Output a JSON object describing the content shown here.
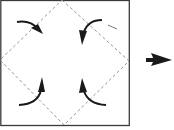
{
  "diagram": {
    "colors": {
      "paper_fill": "#ffffff",
      "paper_border": "#3a3a3a",
      "fold_line": "#8a8a8a",
      "arrow": "#1a1a1a",
      "background": "#ffffff"
    },
    "paper_square": {
      "x": 0,
      "y": 0,
      "width": 129,
      "height": 125
    },
    "valley_fold_diamond": {
      "top": [
        62,
        0
      ],
      "right": [
        129,
        61
      ],
      "bottom": [
        64,
        125
      ],
      "left": [
        0,
        60
      ]
    },
    "fold_arrows": [
      {
        "corner": "top-left",
        "direction": "toward-center"
      },
      {
        "corner": "top-right",
        "direction": "toward-center"
      },
      {
        "corner": "bottom-left",
        "direction": "toward-center"
      },
      {
        "corner": "bottom-right",
        "direction": "toward-center"
      }
    ],
    "next_step_arrow": {
      "direction": "right"
    },
    "icons": {
      "fold_arrow": "curved-arrow-icon",
      "next_step": "right-arrow-icon"
    }
  }
}
